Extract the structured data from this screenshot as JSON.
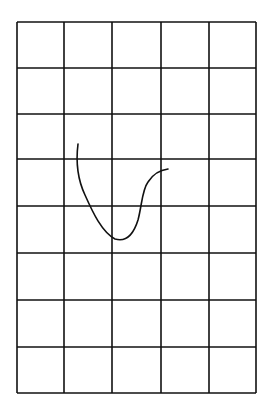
{
  "diagram": {
    "type": "grid-with-hand-drawn-curve",
    "background": "#ffffff",
    "line_color": "#111111",
    "grid": {
      "columns": 5,
      "rows": 8,
      "col_lines_x": [
        17,
        64,
        112,
        161,
        209,
        256
      ],
      "row_lines_y": [
        22,
        68,
        114,
        159,
        206,
        253,
        300,
        347,
        393
      ]
    },
    "curve": {
      "description": "hand-drawn U/J-shaped stroke crossing grid cells",
      "path": "M78,144 C76,160 77,178 85,195 C93,213 102,232 115,239 C125,242 133,236 138,220 C142,205 142,190 148,182 C153,174 160,170 168,169"
    }
  }
}
